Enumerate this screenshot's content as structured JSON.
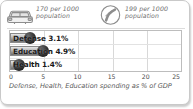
{
  "stats": [
    {
      "icon": "car-icon",
      "value": "170 per 1000",
      "unit": "population",
      "full_text": "170 per 1000 population"
    },
    {
      "icon": "telephone-circle-icon",
      "value": "199 per 1000",
      "unit": "population",
      "full_text": "199 per 1000 population"
    }
  ],
  "chart_data": {
    "type": "bar",
    "orientation": "horizontal",
    "title": "",
    "categories": [
      "Defense",
      "Education",
      "Health"
    ],
    "values": [
      3.1,
      4.9,
      1.4
    ],
    "bar_labels": [
      "Defense 3.1%",
      "Education 4.9%",
      "Health 1.4%"
    ],
    "xlabel": "",
    "ylabel": "",
    "xlim": [
      0,
      25
    ],
    "xticks": [
      "0",
      "5",
      "10",
      "15",
      "20",
      "25"
    ],
    "xtick_values": [
      0,
      5,
      10,
      15,
      20,
      25
    ],
    "grid": true,
    "legend": "none",
    "caption": "Defense, Health, Education spending as % of GDP",
    "bar_color": "#8e8e8e",
    "grid_color": "#d8d8d8",
    "frame_color": "#bdbdbd"
  },
  "colors": {
    "card_border": "#c9c9c9",
    "text_muted": "#6e6e6e",
    "text_dark": "#1a1a1a",
    "caption": "#5a5a5a"
  }
}
